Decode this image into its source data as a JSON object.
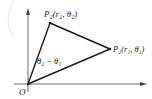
{
  "diagram": {
    "title": "",
    "points": {
      "origin": {
        "label": "O",
        "x": 28,
        "y": 84
      },
      "p2": {
        "label": "P₂(r₂, θ₂)",
        "x": 50,
        "y": 23
      },
      "p1": {
        "label": "P₁(r₁, θ₁)",
        "x": 110,
        "y": 49
      }
    },
    "angle_label": "θ₂ − θ₁",
    "colors": {
      "axis": "#444444",
      "line": "#1a1a1a",
      "faint_arc": "#e6e6e6",
      "text": "#222222"
    }
  }
}
